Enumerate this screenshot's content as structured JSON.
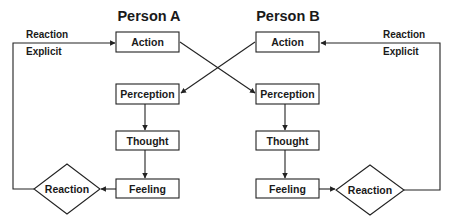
{
  "diagram": {
    "type": "communication-loop flowchart",
    "person_a": {
      "title": "Person A",
      "nodes": {
        "action": "Action",
        "perception": "Perception",
        "thought": "Thought",
        "feeling": "Feeling",
        "reaction": "Reaction"
      },
      "loop_label_line1": "Reaction",
      "loop_label_line2": "Explicit"
    },
    "person_b": {
      "title": "Person B",
      "nodes": {
        "action": "Action",
        "perception": "Perception",
        "thought": "Thought",
        "feeling": "Feeling",
        "reaction": "Reaction"
      },
      "loop_label_line1": "Reaction",
      "loop_label_line2": "Explicit"
    },
    "edges": [
      {
        "from": "A.Action",
        "to": "B.Perception"
      },
      {
        "from": "B.Action",
        "to": "A.Perception"
      },
      {
        "from": "A.Perception",
        "to": "A.Thought"
      },
      {
        "from": "A.Thought",
        "to": "A.Feeling"
      },
      {
        "from": "A.Feeling",
        "to": "A.Reaction"
      },
      {
        "from": "A.Reaction",
        "to": "A.Action",
        "label": "Reaction Explicit"
      },
      {
        "from": "B.Perception",
        "to": "B.Thought"
      },
      {
        "from": "B.Thought",
        "to": "B.Feeling"
      },
      {
        "from": "B.Feeling",
        "to": "B.Reaction"
      },
      {
        "from": "B.Reaction",
        "to": "B.Action",
        "label": "Reaction Explicit"
      }
    ],
    "colors": {
      "stroke": "#222222",
      "text": "#1a1a1a",
      "background": "#ffffff"
    }
  }
}
